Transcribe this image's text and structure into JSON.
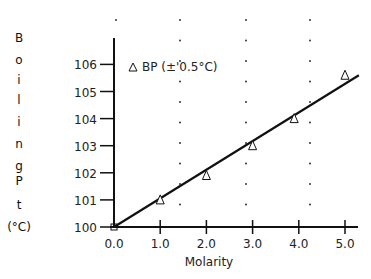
{
  "chart_data": {
    "type": "scatter",
    "title": "",
    "xlabel": "Molarity",
    "ylabel": "Boiling Pt (°C)",
    "ylabel_lines": [
      "B",
      "o",
      "i",
      "l",
      "i",
      "n",
      "g",
      "",
      "P",
      "t",
      "(°C)"
    ],
    "xlim": [
      0,
      5.3
    ],
    "ylim": [
      100,
      106.6
    ],
    "x_ticks": [
      0,
      1,
      2,
      3,
      4,
      5
    ],
    "x_tick_labels": [
      "0.0",
      "1.0",
      "2.0",
      "3.0",
      "4.0",
      "5.0"
    ],
    "y_ticks": [
      100,
      101,
      102,
      103,
      104,
      105,
      106
    ],
    "y_tick_labels": [
      "100",
      "101",
      "102",
      "103",
      "104",
      "105",
      "106"
    ],
    "grid": "dotted vertical guide dots",
    "legend": {
      "position": "upper-left",
      "entries": [
        {
          "marker": "triangle",
          "label": "BP (±'0.5°C)"
        }
      ]
    },
    "series": [
      {
        "name": "BP (±'0.5°C)",
        "marker": "triangle",
        "x": [
          1.0,
          2.0,
          3.0,
          3.9,
          5.0
        ],
        "y": [
          101.0,
          101.9,
          103.0,
          104.0,
          105.6
        ]
      }
    ],
    "fit_line": {
      "x": [
        0,
        5.3
      ],
      "y": [
        100.0,
        105.6
      ]
    }
  },
  "colors": {
    "ink": "#111111",
    "background": "#ffffff",
    "dots": "#333333"
  }
}
